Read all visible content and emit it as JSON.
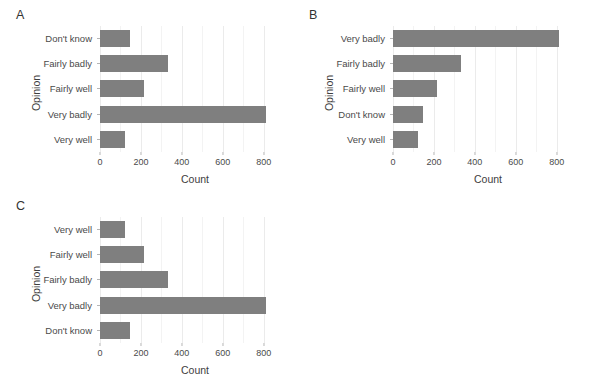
{
  "figure": {
    "background": "#ffffff",
    "bar_color": "#7f7f7f",
    "grid_color": "#ebebeb",
    "width": 593,
    "height": 383
  },
  "panels": [
    {
      "tag": "A",
      "ylabel": "Opinion",
      "xlabel": "Count"
    },
    {
      "tag": "B",
      "ylabel": "Opinion",
      "xlabel": "Count"
    },
    {
      "tag": "C",
      "ylabel": "Opinion",
      "xlabel": "Count"
    }
  ],
  "axis": {
    "xticks": [
      0,
      200,
      400,
      600,
      800
    ],
    "xtick_labels": [
      "0",
      "200",
      "400",
      "600",
      "800"
    ],
    "xmin": 0,
    "xmax": 870
  },
  "chart_data": [
    {
      "type": "bar",
      "orientation": "horizontal",
      "title": "A",
      "xlabel": "Count",
      "ylabel": "Opinion",
      "categories": [
        "Don't know",
        "Fairly badly",
        "Fairly well",
        "Very badly",
        "Very well"
      ],
      "values": [
        147,
        330,
        215,
        812,
        120
      ],
      "ordering": "alphabetical",
      "xlim": [
        0,
        870
      ],
      "xticks": [
        0,
        200,
        400,
        600,
        800
      ],
      "grid": true,
      "legend": "none"
    },
    {
      "type": "bar",
      "orientation": "horizontal",
      "title": "B",
      "xlabel": "Count",
      "ylabel": "Opinion",
      "categories": [
        "Very badly",
        "Fairly badly",
        "Fairly well",
        "Don't know",
        "Very well"
      ],
      "values": [
        812,
        330,
        215,
        147,
        120
      ],
      "ordering": "descending-by-count",
      "xlim": [
        0,
        870
      ],
      "xticks": [
        0,
        200,
        400,
        600,
        800
      ],
      "grid": true,
      "legend": "none"
    },
    {
      "type": "bar",
      "orientation": "horizontal",
      "title": "C",
      "xlabel": "Count",
      "ylabel": "Opinion",
      "categories": [
        "Very well",
        "Fairly well",
        "Fairly badly",
        "Very badly",
        "Don't know"
      ],
      "values": [
        120,
        215,
        330,
        812,
        147
      ],
      "ordering": "ordinal-with-dont-know-last",
      "xlim": [
        0,
        870
      ],
      "xticks": [
        0,
        200,
        400,
        600,
        800
      ],
      "grid": true,
      "legend": "none"
    }
  ]
}
